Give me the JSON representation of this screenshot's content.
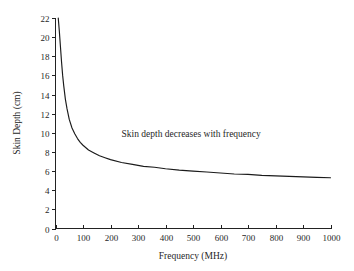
{
  "chart_data": {
    "type": "line",
    "title": "",
    "xlabel": "Frequency (MHz)",
    "ylabel": "Skin Depth (cm)",
    "xlim": [
      0,
      1000
    ],
    "ylim": [
      0,
      22
    ],
    "grid": false,
    "legend": "none",
    "xticks": [
      0,
      100,
      200,
      300,
      400,
      500,
      600,
      700,
      800,
      900,
      1000
    ],
    "xtick_labels": [
      "0",
      "100",
      "200",
      "300",
      "400",
      "500",
      "600",
      "700",
      "800",
      "900",
      "1000"
    ],
    "yticks": [
      0,
      2,
      4,
      6,
      8,
      10,
      12,
      14,
      16,
      18,
      20,
      22
    ],
    "ytick_labels": [
      "0",
      "2",
      "4",
      "6",
      "8",
      "10",
      "12",
      "14",
      "16",
      "18",
      "20",
      "22"
    ],
    "annotations": [
      {
        "text": "Skin depth decreases with frequency",
        "x": 240,
        "y": 9.6
      }
    ],
    "series": [
      {
        "name": "Skin depth",
        "color": "#1b1b1b",
        "x": [
          10,
          14,
          18,
          22,
          26,
          30,
          36,
          42,
          50,
          60,
          70,
          80,
          90,
          100,
          120,
          140,
          160,
          180,
          200,
          240,
          280,
          320,
          360,
          400,
          450,
          500,
          550,
          600,
          650,
          700,
          750,
          800,
          850,
          900,
          950,
          1000
        ],
        "y": [
          22.0,
          20.6,
          19.0,
          17.4,
          16.0,
          14.9,
          13.5,
          12.5,
          11.4,
          10.5,
          9.9,
          9.4,
          9.0,
          8.7,
          8.2,
          7.9,
          7.6,
          7.4,
          7.2,
          6.9,
          6.7,
          6.5,
          6.4,
          6.25,
          6.1,
          6.0,
          5.9,
          5.8,
          5.7,
          5.65,
          5.55,
          5.5,
          5.45,
          5.4,
          5.35,
          5.3
        ]
      }
    ]
  },
  "axes": {
    "y_title": "Skin Depth (cm)",
    "x_title": "Frequency (MHz)"
  }
}
